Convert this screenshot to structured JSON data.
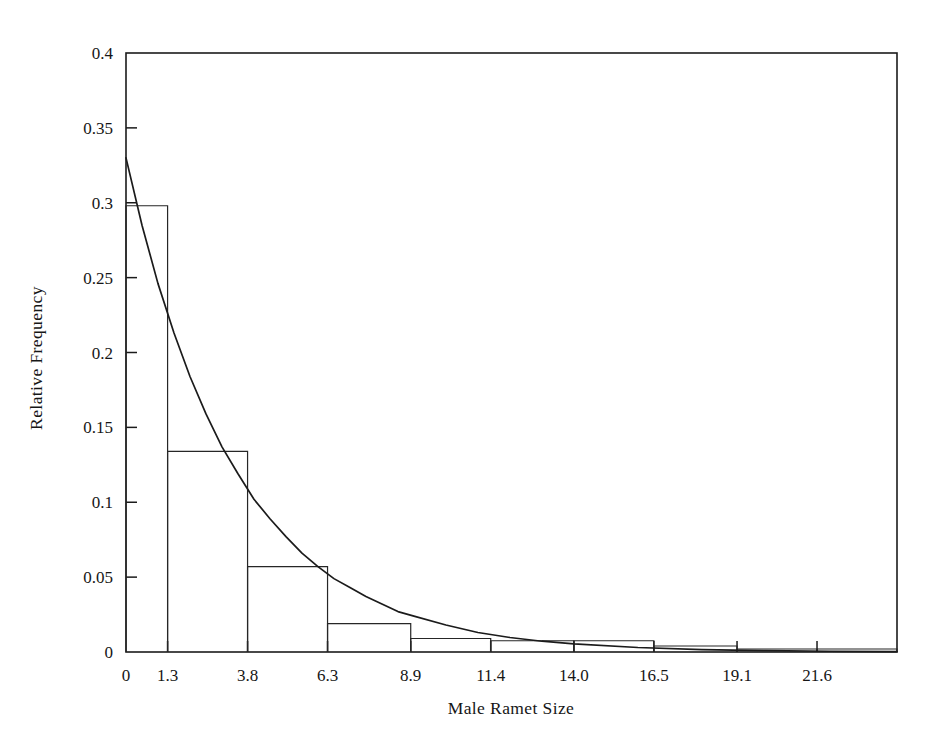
{
  "chart_data": {
    "type": "bar",
    "title": "",
    "subtitle": "",
    "xlabel": "Male Ramet Size",
    "ylabel": "Relative Frequency",
    "xlim": [
      0,
      24.1
    ],
    "ylim": [
      0,
      0.4
    ],
    "grid": false,
    "legend": null,
    "xticks": [
      0,
      1.3,
      3.8,
      6.3,
      8.9,
      11.4,
      14.0,
      16.5,
      19.1,
      21.6
    ],
    "xtick_labels": [
      "0",
      "1.3",
      "3.8",
      "6.3",
      "8.9",
      "11.4",
      "14.0",
      "16.5",
      "19.1",
      "21.6"
    ],
    "yticks": [
      0,
      0.05,
      0.1,
      0.15,
      0.2,
      0.25,
      0.3,
      0.35,
      0.4
    ],
    "ytick_labels": [
      "0",
      "0.05",
      "0.1",
      "0.15",
      "0.2",
      "0.25",
      "0.3",
      "0.35",
      "0.4"
    ],
    "bin_edges": [
      0,
      1.3,
      3.8,
      6.3,
      8.9,
      11.4,
      14.0,
      16.5,
      19.1,
      21.6,
      24.1
    ],
    "categories": [
      "0-1.3",
      "1.3-3.8",
      "3.8-6.3",
      "6.3-8.9",
      "8.9-11.4",
      "11.4-14.0",
      "14.0-16.5",
      "16.5-19.1",
      "19.1-21.6",
      "21.6-24.1"
    ],
    "values": [
      0.298,
      0.134,
      0.057,
      0.019,
      0.009,
      0.0075,
      0.0075,
      0.004,
      0.002,
      0.002
    ],
    "series": [
      {
        "name": "Relative frequency histogram",
        "type": "bar",
        "values": [
          0.298,
          0.134,
          0.057,
          0.019,
          0.009,
          0.0075,
          0.0075,
          0.004,
          0.002,
          0.002
        ]
      },
      {
        "name": "Fitted exponential curve",
        "type": "line",
        "x": [
          0,
          0.5,
          1.0,
          1.5,
          2.0,
          2.5,
          3.0,
          3.5,
          4.0,
          4.5,
          5.0,
          5.5,
          6.0,
          6.5,
          7.0,
          7.5,
          8.0,
          8.5,
          9.0,
          10.0,
          11.0,
          12.0,
          13.0,
          14.0,
          16.0,
          18.0,
          20.0,
          22.0,
          24.1
        ],
        "y": [
          0.33,
          0.285,
          0.246,
          0.213,
          0.184,
          0.159,
          0.137,
          0.119,
          0.102,
          0.089,
          0.077,
          0.066,
          0.057,
          0.049,
          0.043,
          0.037,
          0.032,
          0.027,
          0.024,
          0.018,
          0.013,
          0.0097,
          0.0072,
          0.0054,
          0.003,
          0.0016,
          0.0009,
          0.0005,
          0.0003
        ]
      }
    ]
  },
  "axes": {
    "x_title": "Male Ramet Size",
    "y_title": "Relative Frequency"
  }
}
